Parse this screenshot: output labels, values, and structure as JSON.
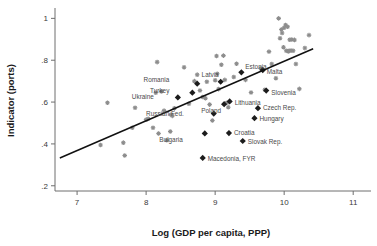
{
  "chart_data": {
    "type": "scatter",
    "title": "",
    "subtitle": "",
    "xlabel": "Log (GDP per capita, PPP)",
    "ylabel": "Indicator (ports)",
    "xlim": [
      6.68,
      11.2
    ],
    "ylim": [
      0.175,
      1.04
    ],
    "grid": false,
    "legend": "none",
    "xticks": [
      7,
      8,
      9,
      10,
      11
    ],
    "xticklabels": [
      "7",
      "8",
      "9",
      "10",
      "11"
    ],
    "yticks": [
      0.2,
      0.4,
      0.6,
      0.8,
      1
    ],
    "yticklabels": [
      ".2",
      ".4",
      ".6",
      ".8",
      "1"
    ],
    "fit_line": {
      "description": "linear fit",
      "x": [
        6.75,
        10.42
      ],
      "y": [
        0.333,
        0.855
      ]
    },
    "series": [
      {
        "name": "Highlighted countries",
        "marker": "diamond",
        "color": "#1c1c1c",
        "points": [
          {
            "label": "Estonia",
            "x": 9.38,
            "y": 0.742,
            "label_dx": 4,
            "label_dy": -3
          },
          {
            "label": "Malta",
            "x": 9.69,
            "y": 0.753,
            "label_dx": 4,
            "label_dy": 4
          },
          {
            "label": "Slovenia",
            "x": 9.74,
            "y": 0.655,
            "label_dx": 5,
            "label_dy": 4
          },
          {
            "label": "Czech Rep.",
            "x": 9.62,
            "y": 0.571,
            "label_dx": 5,
            "label_dy": 2
          },
          {
            "label": "Hungary",
            "x": 9.57,
            "y": 0.523,
            "label_dx": 5,
            "label_dy": 3
          },
          {
            "label": "Slovak Rep.",
            "x": 9.4,
            "y": 0.414,
            "label_dx": 5,
            "label_dy": 3
          },
          {
            "label": "Croatia",
            "x": 9.2,
            "y": 0.452,
            "label_dx": 5,
            "label_dy": 2
          },
          {
            "label": "Lithuania",
            "x": 9.21,
            "y": 0.603,
            "label_dx": 5,
            "label_dy": 4
          },
          {
            "label": "Latvia",
            "x": 9.08,
            "y": 0.697,
            "label_dx": -2,
            "label_dy": -5
          },
          {
            "label": "Poland",
            "x": 9.13,
            "y": 0.59,
            "label_dx": -3,
            "label_dy": 9
          },
          {
            "label": "Russian Fed.",
            "x": 8.98,
            "y": 0.545,
            "label_dx": -30,
            "label_dy": 2
          },
          {
            "label": "Bulgaria",
            "x": 8.85,
            "y": 0.45,
            "label_dx": -22,
            "label_dy": 9
          },
          {
            "label": "Macedonia, FYR",
            "x": 8.82,
            "y": 0.333,
            "label_dx": 5,
            "label_dy": 3
          },
          {
            "label": "Romania",
            "x": 8.74,
            "y": 0.688,
            "label_dx": -28,
            "label_dy": -2
          },
          {
            "label": "Turkey",
            "x": 8.67,
            "y": 0.645,
            "label_dx": -23,
            "label_dy": 0
          },
          {
            "label": "Ukraine",
            "x": 8.46,
            "y": 0.622,
            "label_dx": -24,
            "label_dy": 2
          }
        ]
      },
      {
        "name": "Other countries",
        "marker": "cross",
        "color": "#8d8d8d",
        "points": [
          {
            "x": 7.34,
            "y": 0.395
          },
          {
            "x": 7.44,
            "y": 0.597
          },
          {
            "x": 7.67,
            "y": 0.406
          },
          {
            "x": 7.69,
            "y": 0.345
          },
          {
            "x": 7.8,
            "y": 0.477
          },
          {
            "x": 7.84,
            "y": 0.573
          },
          {
            "x": 8.0,
            "y": 0.516
          },
          {
            "x": 8.03,
            "y": 0.52
          },
          {
            "x": 8.1,
            "y": 0.477
          },
          {
            "x": 8.14,
            "y": 0.645
          },
          {
            "x": 8.16,
            "y": 0.791
          },
          {
            "x": 8.18,
            "y": 0.45
          },
          {
            "x": 8.22,
            "y": 0.651
          },
          {
            "x": 8.26,
            "y": 0.559
          },
          {
            "x": 8.3,
            "y": 0.418
          },
          {
            "x": 8.35,
            "y": 0.459
          },
          {
            "x": 8.36,
            "y": 0.54
          },
          {
            "x": 8.38,
            "y": 0.534
          },
          {
            "x": 8.41,
            "y": 0.57
          },
          {
            "x": 8.55,
            "y": 0.766
          },
          {
            "x": 8.62,
            "y": 0.592
          },
          {
            "x": 8.7,
            "y": 0.7
          },
          {
            "x": 8.74,
            "y": 0.731
          },
          {
            "x": 8.78,
            "y": 0.655
          },
          {
            "x": 8.82,
            "y": 0.624
          },
          {
            "x": 8.86,
            "y": 0.618
          },
          {
            "x": 8.88,
            "y": 0.697
          },
          {
            "x": 8.92,
            "y": 0.588
          },
          {
            "x": 8.96,
            "y": 0.512
          },
          {
            "x": 9.0,
            "y": 0.704
          },
          {
            "x": 9.02,
            "y": 0.82
          },
          {
            "x": 9.03,
            "y": 0.735
          },
          {
            "x": 9.05,
            "y": 0.662
          },
          {
            "x": 9.09,
            "y": 0.778
          },
          {
            "x": 9.12,
            "y": 0.822
          },
          {
            "x": 9.14,
            "y": 0.706
          },
          {
            "x": 9.17,
            "y": 0.597
          },
          {
            "x": 9.19,
            "y": 0.575
          },
          {
            "x": 9.27,
            "y": 0.72
          },
          {
            "x": 9.31,
            "y": 0.783
          },
          {
            "x": 9.44,
            "y": 0.706
          },
          {
            "x": 9.52,
            "y": 0.646
          },
          {
            "x": 9.66,
            "y": 0.76
          },
          {
            "x": 9.72,
            "y": 0.659
          },
          {
            "x": 9.78,
            "y": 0.841
          },
          {
            "x": 9.82,
            "y": 0.782
          },
          {
            "x": 9.88,
            "y": 0.714
          },
          {
            "x": 9.92,
            "y": 1.0
          },
          {
            "x": 9.94,
            "y": 0.905
          },
          {
            "x": 9.96,
            "y": 0.947
          },
          {
            "x": 9.97,
            "y": 0.93
          },
          {
            "x": 9.99,
            "y": 0.862
          },
          {
            "x": 10.0,
            "y": 0.955
          },
          {
            "x": 10.02,
            "y": 0.968
          },
          {
            "x": 10.03,
            "y": 0.845
          },
          {
            "x": 10.05,
            "y": 0.96
          },
          {
            "x": 10.06,
            "y": 0.842
          },
          {
            "x": 10.07,
            "y": 0.845
          },
          {
            "x": 10.08,
            "y": 0.898
          },
          {
            "x": 10.1,
            "y": 0.846
          },
          {
            "x": 10.11,
            "y": 0.899
          },
          {
            "x": 10.13,
            "y": 0.845
          },
          {
            "x": 10.15,
            "y": 0.897
          },
          {
            "x": 10.17,
            "y": 0.782
          },
          {
            "x": 10.22,
            "y": 0.663
          },
          {
            "x": 10.36,
            "y": 0.92
          },
          {
            "x": 10.3,
            "y": 0.858
          }
        ]
      }
    ]
  }
}
